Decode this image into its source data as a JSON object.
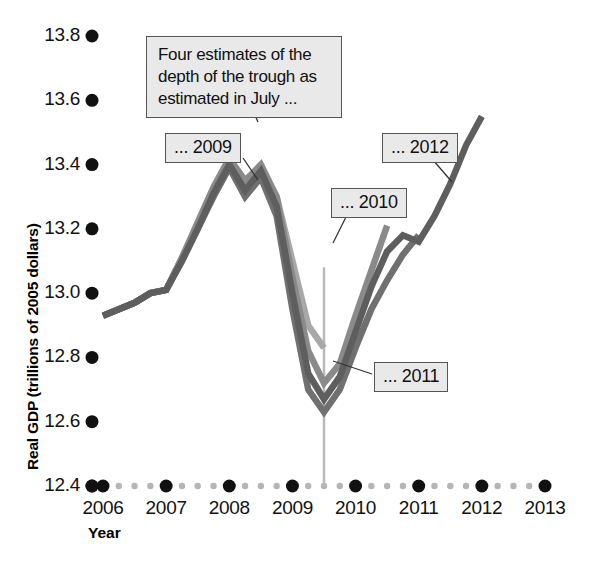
{
  "chart_data": {
    "type": "line",
    "title": "",
    "xlabel": "Year",
    "ylabel": "Real GDP (trillions of 2005 dollars)",
    "xlim": [
      2006.0,
      2013.0
    ],
    "ylim": [
      12.4,
      13.8
    ],
    "ytick_labels": [
      "13.8",
      "13.6",
      "13.4",
      "13.2",
      "13.0",
      "12.8",
      "12.6",
      "12.4"
    ],
    "ytick_values": [
      13.8,
      13.6,
      13.4,
      13.2,
      13.0,
      12.8,
      12.6,
      12.4
    ],
    "xtick_labels": [
      "2006",
      "2007",
      "2008",
      "2009",
      "2010",
      "2011",
      "2012",
      "2013"
    ],
    "xtick_values": [
      2006,
      2007,
      2008,
      2009,
      2010,
      2011,
      2012,
      2013
    ],
    "grid": false,
    "legend_position": "inline-callouts",
    "annotation": "Four estimates of the depth of the trough as estimated in July ...",
    "reference_line_x": 2009.5,
    "series": [
      {
        "name": "... 2009",
        "color": "#a8a8a8",
        "x": [
          2006.0,
          2006.25,
          2006.5,
          2006.75,
          2007.0,
          2007.25,
          2007.5,
          2007.75,
          2008.0,
          2008.25,
          2008.5,
          2008.75,
          2009.0,
          2009.25,
          2009.5
        ],
        "values": [
          12.93,
          12.95,
          12.97,
          13.0,
          13.01,
          13.11,
          13.21,
          13.32,
          13.41,
          13.34,
          13.39,
          13.3,
          13.1,
          12.9,
          12.83
        ]
      },
      {
        "name": "... 2010",
        "color": "#8a8a8a",
        "x": [
          2006.0,
          2006.25,
          2006.5,
          2006.75,
          2007.0,
          2007.25,
          2007.5,
          2007.75,
          2008.0,
          2008.25,
          2008.5,
          2008.75,
          2009.0,
          2009.25,
          2009.5,
          2009.75,
          2010.0,
          2010.25,
          2010.5
        ],
        "values": [
          12.93,
          12.95,
          12.97,
          13.0,
          13.01,
          13.11,
          13.22,
          13.33,
          13.42,
          13.35,
          13.4,
          13.3,
          13.05,
          12.82,
          12.72,
          12.78,
          12.93,
          13.07,
          13.21
        ]
      },
      {
        "name": "... 2011",
        "color": "#707070",
        "x": [
          2006.0,
          2006.25,
          2006.5,
          2006.75,
          2007.0,
          2007.25,
          2007.5,
          2007.75,
          2008.0,
          2008.25,
          2008.5,
          2008.75,
          2009.0,
          2009.25,
          2009.5,
          2009.75,
          2010.0,
          2010.25,
          2010.5,
          2010.75,
          2011.0
        ],
        "values": [
          12.93,
          12.95,
          12.97,
          13.0,
          13.01,
          13.1,
          13.2,
          13.3,
          13.39,
          13.3,
          13.36,
          13.24,
          12.95,
          12.7,
          12.63,
          12.7,
          12.83,
          12.95,
          13.04,
          13.12,
          13.18
        ]
      },
      {
        "name": "... 2012",
        "color": "#5e5e5e",
        "x": [
          2006.0,
          2006.25,
          2006.5,
          2006.75,
          2007.0,
          2007.25,
          2007.5,
          2007.75,
          2008.0,
          2008.25,
          2008.5,
          2008.75,
          2009.0,
          2009.25,
          2009.5,
          2009.75,
          2010.0,
          2010.25,
          2010.5,
          2010.75,
          2011.0,
          2011.25,
          2011.5,
          2011.75,
          2012.0
        ],
        "values": [
          12.93,
          12.95,
          12.97,
          13.0,
          13.01,
          13.1,
          13.2,
          13.31,
          13.4,
          13.32,
          13.38,
          13.27,
          13.0,
          12.75,
          12.67,
          12.74,
          12.88,
          13.02,
          13.13,
          13.18,
          13.16,
          13.24,
          13.34,
          13.46,
          13.55
        ]
      }
    ]
  },
  "axis": {
    "y_title": "Real GDP (trillions of 2005 dollars)",
    "x_title": "Year",
    "y_ticks": [
      "13.8",
      "13.6",
      "13.4",
      "13.2",
      "13.0",
      "12.8",
      "12.6",
      "12.4"
    ],
    "x_ticks": [
      "2006",
      "2007",
      "2008",
      "2009",
      "2010",
      "2011",
      "2012",
      "2013"
    ]
  },
  "annotations": {
    "note": "Four estimates of the depth of the trough as estimated in July ...",
    "note_line1": "Four estimates of the",
    "note_line2": "depth of the trough as",
    "note_line3": "estimated in July ...",
    "label_2009": "... 2009",
    "label_2010": "... 2010",
    "label_2011": "... 2011",
    "label_2012": "... 2012"
  },
  "colors": {
    "series_2009": "#a8a8a8",
    "series_2010": "#8a8a8a",
    "series_2011": "#707070",
    "series_2012": "#5e5e5e",
    "axis_dot_major": "#111111",
    "axis_dot_minor": "#b5b5b5",
    "reference_line": "#b9b9b9",
    "callout_bg": "#e9e9e9",
    "callout_border": "#555555"
  }
}
